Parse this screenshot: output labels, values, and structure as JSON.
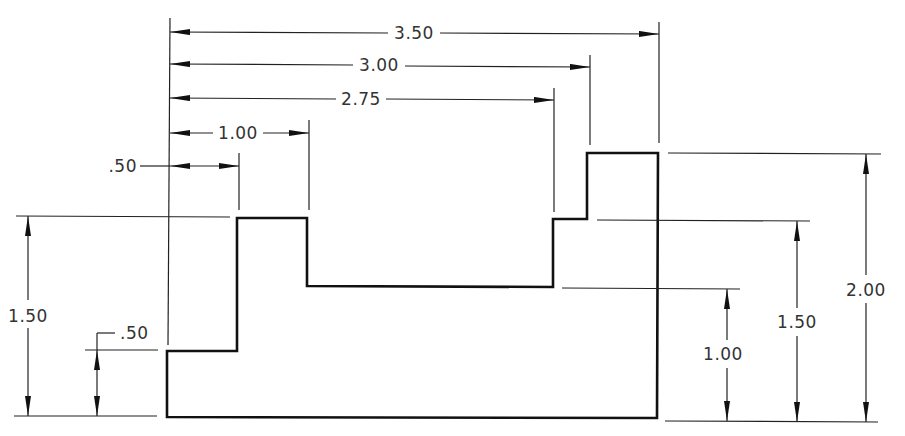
{
  "drawing": {
    "title": "Stepped block dimensioned drawing",
    "units": "in",
    "colors": {
      "object_line": "#111111",
      "dim_line": "#222222",
      "text": "#333333",
      "background": "#ffffff"
    },
    "horizontal_dimensions": [
      {
        "id": "h350",
        "label": "3.50",
        "from": 0,
        "to": 3.5
      },
      {
        "id": "h300",
        "label": "3.00",
        "from": 0,
        "to": 3.0
      },
      {
        "id": "h275",
        "label": "2.75",
        "from": 0,
        "to": 2.75
      },
      {
        "id": "h100",
        "label": "1.00",
        "from": 0,
        "to": 1.0
      },
      {
        "id": "h050",
        "label": ".50",
        "from": 0,
        "to": 0.5
      }
    ],
    "vertical_dimensions_left": [
      {
        "id": "vl150",
        "label": "1.50",
        "from": 0,
        "to": 1.5
      },
      {
        "id": "vl050",
        "label": ".50",
        "from": 0,
        "to": 0.5
      }
    ],
    "vertical_dimensions_right": [
      {
        "id": "vr100",
        "label": "1.00",
        "from": 0,
        "to": 1.0
      },
      {
        "id": "vr150",
        "label": "1.50",
        "from": 0,
        "to": 1.5
      },
      {
        "id": "vr200",
        "label": "2.00",
        "from": 0,
        "to": 2.0
      }
    ],
    "profile_points": [
      [
        0,
        0
      ],
      [
        0,
        0.5
      ],
      [
        0.5,
        0.5
      ],
      [
        0.5,
        1.5
      ],
      [
        1.0,
        1.5
      ],
      [
        1.0,
        1.0
      ],
      [
        2.75,
        1.0
      ],
      [
        2.75,
        1.5
      ],
      [
        3.0,
        1.5
      ],
      [
        3.0,
        2.0
      ],
      [
        3.5,
        2.0
      ],
      [
        3.5,
        0
      ]
    ]
  }
}
